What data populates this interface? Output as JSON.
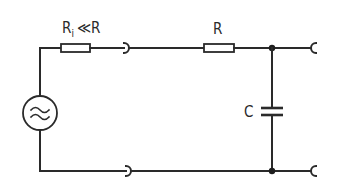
{
  "diagram": {
    "type": "circuit-schematic",
    "colors": {
      "line": "#2a2a2a",
      "background": "#ffffff"
    },
    "components": {
      "source": {
        "symbol": "ac-voltage-source",
        "glyph": "≈"
      },
      "internal_resistor": {
        "symbol": "resistor",
        "label_main": "R",
        "label_sub": "i",
        "label_rest": "≪R"
      },
      "resistor": {
        "symbol": "resistor",
        "label": "R"
      },
      "capacitor": {
        "symbol": "capacitor",
        "label": "C"
      }
    },
    "terminals": {
      "input_top": "open-terminal",
      "input_bottom": "open-terminal",
      "output_top": "open-terminal",
      "output_bottom": "open-terminal"
    },
    "junctions": [
      "top-node",
      "bottom-node"
    ]
  }
}
